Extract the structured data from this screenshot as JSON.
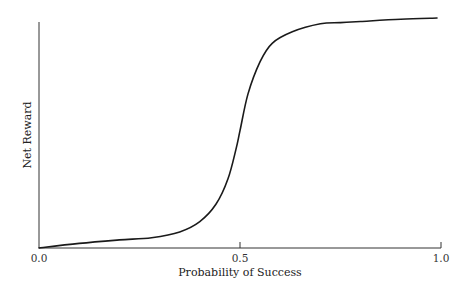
{
  "chart_data": {
    "type": "line",
    "title": "",
    "xlabel": "Probability of Success",
    "ylabel": "Net Reward",
    "xlim": [
      0.0,
      1.0
    ],
    "ylim": [
      0.0,
      1.0
    ],
    "x_ticks": [
      {
        "value": 0.0,
        "label": "0.0"
      },
      {
        "value": 0.5,
        "label": "0.5"
      },
      {
        "value": 1.0,
        "label": "1.0"
      }
    ],
    "y_ticks": [],
    "grid": false,
    "legend": null,
    "series": [
      {
        "name": "Net Reward",
        "color": "#1a1a1a",
        "x": [
          0.0,
          0.1,
          0.2,
          0.28,
          0.35,
          0.4,
          0.44,
          0.47,
          0.49,
          0.5,
          0.52,
          0.55,
          0.58,
          0.63,
          0.7,
          0.75,
          0.8,
          0.9,
          0.99
        ],
        "y": [
          0.0,
          0.02,
          0.035,
          0.045,
          0.07,
          0.115,
          0.19,
          0.3,
          0.43,
          0.51,
          0.67,
          0.81,
          0.89,
          0.94,
          0.975,
          0.98,
          0.985,
          0.995,
          1.0
        ]
      }
    ]
  }
}
